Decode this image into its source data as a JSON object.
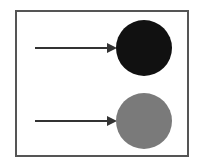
{
  "diagram": {
    "rows": [
      {
        "arrow": {
          "x1": 35,
          "x2": 115,
          "y": 48
        },
        "circle": {
          "cx": 144,
          "cy": 48,
          "r": 28,
          "color": "#111111"
        }
      },
      {
        "arrow": {
          "x1": 35,
          "x2": 115,
          "y": 121
        },
        "circle": {
          "cx": 144,
          "cy": 121,
          "r": 28,
          "color": "#7a7a7a"
        }
      }
    ],
    "arrow_color": "#333333",
    "frame_color": "#555555"
  }
}
